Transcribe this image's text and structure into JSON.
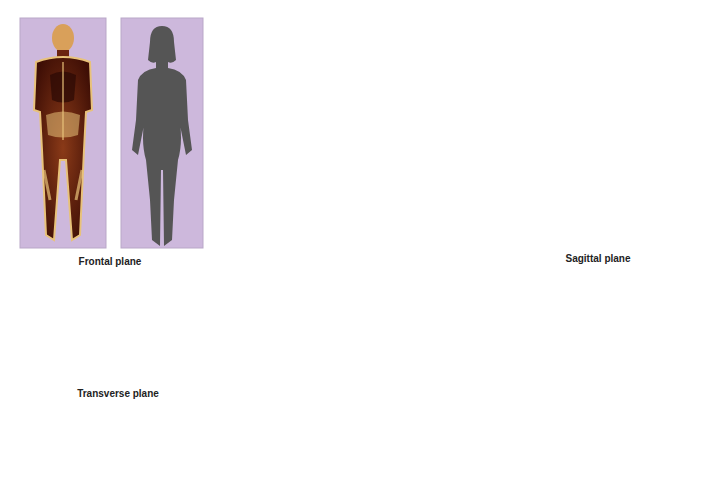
{
  "diagram": {
    "colors": {
      "frontal_plane": "#cdb8dc",
      "sagittal_plane": "#e1e4f2",
      "transverse_plane": "#dcecd6",
      "silhouette": "#555555",
      "skin": "#f3b99a",
      "hair": "#8b4a2a",
      "section_tissue": "#5a1a0a",
      "section_bone": "#e8c27a"
    },
    "planes": [
      {
        "id": "frontal",
        "label": "Frontal plane",
        "panels": [
          "Anatomical frontal section",
          "Frontal silhouette"
        ],
        "arrow_direction": "left"
      },
      {
        "id": "sagittal",
        "label": "Sagittal plane",
        "panels": [
          "Sagittal silhouette",
          "Anatomical sagittal section"
        ],
        "arrow_direction": "right"
      },
      {
        "id": "transverse",
        "label": "Transverse plane",
        "panels": [
          "Anatomical transverse section",
          "Transverse silhouette"
        ],
        "arrow_direction": "down-left"
      }
    ]
  }
}
